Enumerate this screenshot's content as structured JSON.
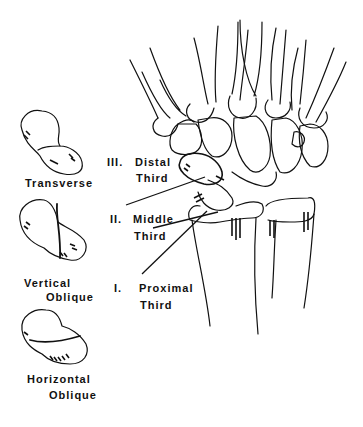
{
  "fracture_types": [
    {
      "label": "Transverse"
    },
    {
      "label_line1": "Vertical",
      "label_line2": "Oblique"
    },
    {
      "label_line1": "Horizontal",
      "label_line2": "Oblique"
    }
  ],
  "regions": [
    {
      "numeral": "III.",
      "line1": "Distal",
      "line2": "Third"
    },
    {
      "numeral": "II.",
      "line1": "Middle",
      "line2": "Third"
    },
    {
      "numeral": "I.",
      "line1": "Proximal",
      "line2": "Third"
    }
  ]
}
